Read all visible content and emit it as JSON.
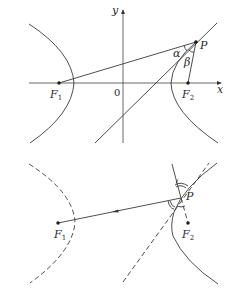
{
  "figure_top": {
    "title": "Hyperbola with foci and tangent line at P",
    "axes": {
      "x_label": "x",
      "y_label": "y",
      "origin_label": "0"
    },
    "points": {
      "F1": {
        "label": "F",
        "subscript": "1"
      },
      "F2": {
        "label": "F",
        "subscript": "2"
      },
      "P": {
        "label": "P"
      }
    },
    "angles": {
      "alpha": "α",
      "beta": "β"
    }
  },
  "figure_bottom": {
    "title": "Reflection property of the hyperbola",
    "points": {
      "F1": {
        "label": "F",
        "subscript": "1"
      },
      "F2": {
        "label": "F",
        "subscript": "2"
      },
      "P": {
        "label": "P"
      }
    }
  },
  "colors": {
    "stroke": "#3a3a3a",
    "background": "#ffffff"
  }
}
